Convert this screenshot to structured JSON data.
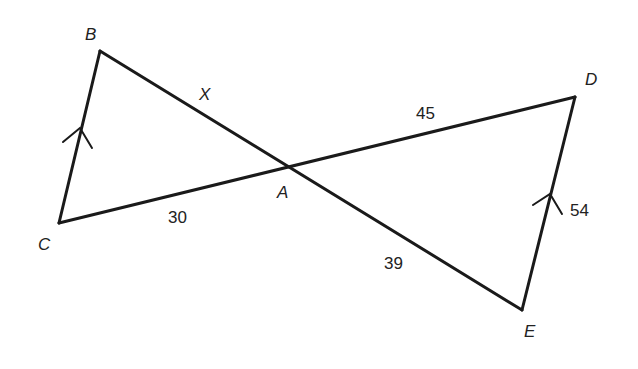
{
  "diagram": {
    "type": "geometry",
    "vertices": {
      "B": {
        "label": "B",
        "x": 100,
        "y": 51
      },
      "C": {
        "label": "C",
        "x": 59,
        "y": 223
      },
      "A": {
        "label": "A",
        "x": 288,
        "y": 166
      },
      "D": {
        "label": "D",
        "x": 575,
        "y": 97
      },
      "E": {
        "label": "E",
        "x": 522,
        "y": 310
      }
    },
    "segments": [
      {
        "from": "B",
        "to": "E",
        "through": "A"
      },
      {
        "from": "C",
        "to": "D",
        "through": "A"
      },
      {
        "from": "B",
        "to": "C",
        "parallel_mark": true
      },
      {
        "from": "D",
        "to": "E",
        "parallel_mark": true
      }
    ],
    "side_labels": {
      "BA": "X",
      "AD": "45",
      "CA": "30",
      "AE": "39",
      "DE": "54"
    },
    "stroke_color": "#1a1a1a"
  }
}
